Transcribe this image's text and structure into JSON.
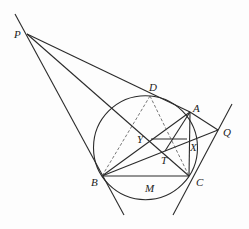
{
  "figure": {
    "colors": {
      "stroke": "#2a2a2a",
      "dashed": "#555555",
      "background": "#fdfdfd"
    },
    "points": {
      "P": {
        "label": "P",
        "x": 27,
        "y": 34
      },
      "D": {
        "label": "D",
        "x": 150,
        "y": 96
      },
      "A": {
        "label": "A",
        "x": 190,
        "y": 112
      },
      "Q": {
        "label": "Q",
        "x": 218,
        "y": 130
      },
      "Y": {
        "label": "Y",
        "x": 151,
        "y": 139
      },
      "T": {
        "label": "T",
        "x": 165,
        "y": 151
      },
      "X": {
        "label": "X",
        "x": 187,
        "y": 139
      },
      "B": {
        "label": "B",
        "x": 102,
        "y": 176
      },
      "C": {
        "label": "C",
        "x": 189,
        "y": 176
      },
      "M": {
        "label": "M"
      }
    },
    "circle": {
      "cx": 145.5,
      "cy": 147.7,
      "r": 52
    }
  }
}
